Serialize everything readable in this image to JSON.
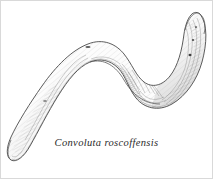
{
  "figure": {
    "kind": "scientific-line-drawing",
    "caption": "Convoluta roscoffensis",
    "background_color": "#ffffff",
    "ink_color": "#3a3a3a",
    "shading_color": "#8d8d8d",
    "border_color": "#d9d9d9",
    "body_fill": "#fbfbfb",
    "pose": "S-shaped sinuous curve, anterior at upper right, posterior tail at lower left",
    "anatomy": {
      "anterior_label": "anterior-head-end",
      "posterior_label": "posterior-tail-end",
      "eyespot_count": 3,
      "midbody_mark": "statocyst",
      "dorsal_mark": "dorsal-pigment-spot"
    }
  }
}
